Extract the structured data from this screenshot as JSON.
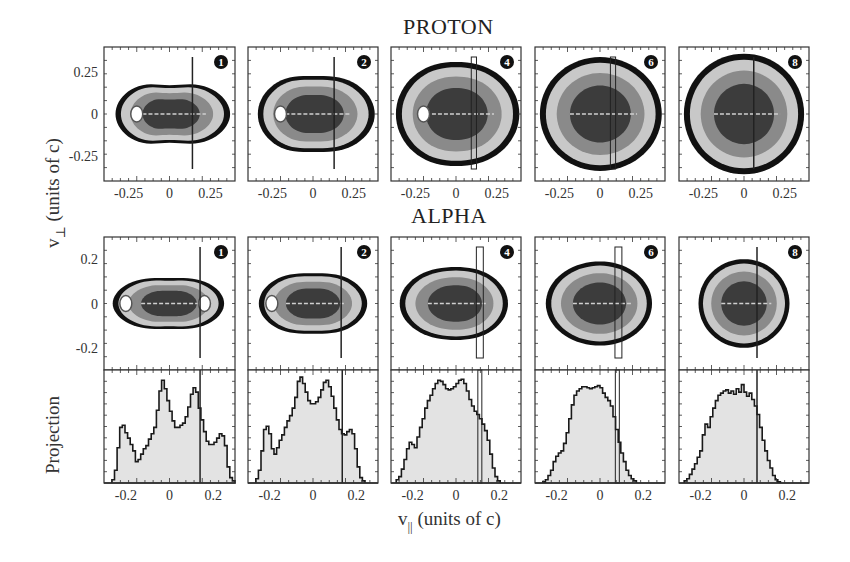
{
  "figure": {
    "row_titles": {
      "proton": "PROTON",
      "alpha": "ALPHA"
    },
    "ylabel_top": {
      "var": "v",
      "sub": "⊥",
      "units": " (units of c)"
    },
    "ylabel_bottom": "Projection",
    "xlabel": {
      "var": "v",
      "sub": "||",
      "units": " (units of c)"
    },
    "colors": {
      "frame": "#333333",
      "contour_outer": "#111111",
      "contour_light": "#c8c8c8",
      "contour_mid": "#8a8a8a",
      "contour_dark": "#3c3c3c",
      "hist_fill": "#e3e3e3",
      "hist_line": "#1a1a1a",
      "background": "#ffffff"
    },
    "panel_labels": [
      "❶",
      "❷",
      "❹",
      "❻",
      "❽"
    ]
  },
  "chart_data": [
    {
      "type": "heatmap",
      "title": "PROTON",
      "row": "proton",
      "xlabel": "v_parallel (units of c)",
      "ylabel": "v_perp (units of c)",
      "xlim": [
        -0.4,
        0.4
      ],
      "ylim": [
        -0.4,
        0.4
      ],
      "xticks": [
        -0.25,
        0,
        0.25
      ],
      "xtick_labels": [
        "-0.25",
        "0",
        "0.25"
      ],
      "yticks": [
        -0.25,
        0,
        0.25
      ],
      "ytick_labels": [
        "-0.25",
        "0",
        "0.25"
      ],
      "panels": [
        {
          "label": "1",
          "marker": "line",
          "marker_x": 0.14,
          "marker_width": 0.0,
          "shape": {
            "rx_left": 0.33,
            "rx_right": 0.37,
            "ry": 0.21,
            "pinch": 0.3
          },
          "holes": [
            [
              -0.2,
              0.0
            ]
          ]
        },
        {
          "label": "2",
          "marker": "line",
          "marker_x": 0.13,
          "marker_width": 0.0,
          "shape": {
            "rx_left": 0.34,
            "rx_right": 0.38,
            "ry": 0.25,
            "pinch": 0.15
          },
          "holes": [
            [
              -0.2,
              0.0
            ]
          ]
        },
        {
          "label": "4",
          "marker": "box",
          "marker_x": 0.11,
          "marker_width": 0.02,
          "shape": {
            "rx_left": 0.37,
            "rx_right": 0.39,
            "ry": 0.32,
            "pinch": 0.05
          },
          "holes": [
            [
              -0.2,
              0.0
            ]
          ]
        },
        {
          "label": "6",
          "marker": "box",
          "marker_x": 0.08,
          "marker_width": 0.02,
          "shape": {
            "rx_left": 0.37,
            "rx_right": 0.38,
            "ry": 0.34,
            "pinch": 0.0
          },
          "holes": []
        },
        {
          "label": "8",
          "marker": "line",
          "marker_x": 0.06,
          "marker_width": 0.0,
          "shape": {
            "rx_left": 0.37,
            "rx_right": 0.37,
            "ry": 0.36,
            "pinch": 0.0
          },
          "holes": []
        }
      ]
    },
    {
      "type": "heatmap",
      "title": "ALPHA",
      "row": "alpha",
      "xlabel": "v_parallel (units of c)",
      "ylabel": "v_perp (units of c)",
      "xlim": [
        -0.3,
        0.3
      ],
      "ylim": [
        -0.3,
        0.3
      ],
      "yticks": [
        -0.2,
        0,
        0.2
      ],
      "ytick_labels": [
        "-0.2",
        "0",
        "0.2"
      ],
      "panels": [
        {
          "label": "1",
          "marker": "line",
          "marker_x": 0.14,
          "marker_width": 0.0,
          "shape": {
            "rx_left": 0.26,
            "rx_right": 0.25,
            "ry": 0.13,
            "pinch": 0.2
          },
          "holes": [
            [
              -0.2,
              0.0
            ],
            [
              0.16,
              0.0
            ]
          ]
        },
        {
          "label": "2",
          "marker": "line",
          "marker_x": 0.13,
          "marker_width": 0.0,
          "shape": {
            "rx_left": 0.25,
            "rx_right": 0.25,
            "ry": 0.15,
            "pinch": 0.15
          },
          "holes": [
            [
              -0.19,
              0.0
            ]
          ]
        },
        {
          "label": "4",
          "marker": "box",
          "marker_x": 0.11,
          "marker_width": 0.02,
          "shape": {
            "rx_left": 0.26,
            "rx_right": 0.24,
            "ry": 0.17,
            "pinch": 0.05
          },
          "holes": []
        },
        {
          "label": "6",
          "marker": "box",
          "marker_x": 0.085,
          "marker_width": 0.02,
          "shape": {
            "rx_left": 0.25,
            "rx_right": 0.24,
            "ry": 0.19,
            "pinch": 0.0
          },
          "holes": []
        },
        {
          "label": "8",
          "marker": "line",
          "marker_x": 0.06,
          "marker_width": 0.0,
          "shape": {
            "rx_left": 0.21,
            "rx_right": 0.21,
            "ry": 0.2,
            "pinch": 0.0
          },
          "holes": []
        }
      ]
    },
    {
      "type": "bar",
      "title": "Projection (ALPHA)",
      "row": "projection",
      "xlabel": "v_parallel (units of c)",
      "ylabel": "Projection",
      "xlim": [
        -0.3,
        0.3
      ],
      "ylim": [
        0,
        1.0
      ],
      "xticks": [
        -0.2,
        0,
        0.2
      ],
      "xtick_labels": [
        "-0.2",
        "0",
        "0.2"
      ],
      "bin_edges_start": -0.3,
      "bin_width": 0.012,
      "panels": [
        {
          "label": "1",
          "marker": "line",
          "marker_x": 0.14,
          "marker_width": 0.0,
          "values": [
            0,
            0,
            0,
            0.03,
            0.12,
            0.33,
            0.52,
            0.54,
            0.47,
            0.42,
            0.36,
            0.3,
            0.2,
            0.22,
            0.27,
            0.32,
            0.35,
            0.41,
            0.46,
            0.52,
            0.68,
            0.86,
            0.96,
            0.88,
            0.77,
            0.67,
            0.58,
            0.52,
            0.52,
            0.54,
            0.56,
            0.62,
            0.71,
            0.83,
            0.89,
            0.85,
            0.7,
            0.59,
            0.48,
            0.39,
            0.36,
            0.36,
            0.38,
            0.42,
            0.46,
            0.44,
            0.35,
            0.15,
            0.05,
            0.02,
            0.0
          ]
        },
        {
          "label": "2",
          "marker": "line",
          "marker_x": 0.135,
          "marker_width": 0.0,
          "values": [
            0,
            0,
            0,
            0.04,
            0.12,
            0.3,
            0.5,
            0.53,
            0.46,
            0.32,
            0.27,
            0.33,
            0.4,
            0.45,
            0.52,
            0.58,
            0.63,
            0.7,
            0.8,
            0.95,
            0.99,
            0.93,
            0.85,
            0.77,
            0.74,
            0.74,
            0.76,
            0.8,
            0.87,
            0.94,
            0.96,
            0.9,
            0.81,
            0.7,
            0.59,
            0.5,
            0.46,
            0.45,
            0.48,
            0.5,
            0.46,
            0.32,
            0.15,
            0.05,
            0.02,
            0.0,
            0,
            0,
            0,
            0,
            0
          ]
        },
        {
          "label": "4",
          "marker": "box",
          "marker_x": 0.11,
          "marker_width": 0.014,
          "values": [
            0,
            0,
            0.03,
            0.06,
            0.13,
            0.22,
            0.32,
            0.38,
            0.36,
            0.33,
            0.43,
            0.52,
            0.6,
            0.7,
            0.77,
            0.82,
            0.88,
            0.93,
            0.96,
            0.95,
            0.92,
            0.88,
            0.87,
            0.88,
            0.9,
            0.93,
            0.96,
            0.97,
            0.93,
            0.86,
            0.78,
            0.72,
            0.67,
            0.64,
            0.6,
            0.55,
            0.49,
            0.4,
            0.27,
            0.14,
            0.06,
            0.02,
            0.0,
            0,
            0,
            0,
            0,
            0,
            0,
            0,
            0
          ]
        },
        {
          "label": "6",
          "marker": "box",
          "marker_x": 0.08,
          "marker_width": 0.012,
          "values": [
            0,
            0,
            0,
            0.01,
            0.03,
            0.07,
            0.12,
            0.2,
            0.25,
            0.28,
            0.3,
            0.37,
            0.47,
            0.6,
            0.73,
            0.82,
            0.86,
            0.88,
            0.9,
            0.9,
            0.89,
            0.88,
            0.89,
            0.9,
            0.91,
            0.89,
            0.84,
            0.8,
            0.77,
            0.72,
            0.62,
            0.5,
            0.38,
            0.28,
            0.2,
            0.12,
            0.07,
            0.04,
            0.02,
            0.0,
            0,
            0,
            0,
            0,
            0,
            0,
            0,
            0,
            0,
            0,
            0
          ]
        },
        {
          "label": "8",
          "marker": "line",
          "marker_x": 0.06,
          "marker_width": 0.0,
          "values": [
            0,
            0,
            0.02,
            0.04,
            0.08,
            0.13,
            0.18,
            0.24,
            0.3,
            0.45,
            0.55,
            0.52,
            0.62,
            0.7,
            0.77,
            0.82,
            0.84,
            0.86,
            0.87,
            0.84,
            0.86,
            0.83,
            0.88,
            0.85,
            0.92,
            0.85,
            0.81,
            0.84,
            0.78,
            0.72,
            0.64,
            0.52,
            0.4,
            0.3,
            0.21,
            0.14,
            0.07,
            0.03,
            0.01,
            0.0,
            0,
            0,
            0,
            0,
            0,
            0,
            0,
            0,
            0,
            0,
            0
          ]
        }
      ]
    }
  ]
}
